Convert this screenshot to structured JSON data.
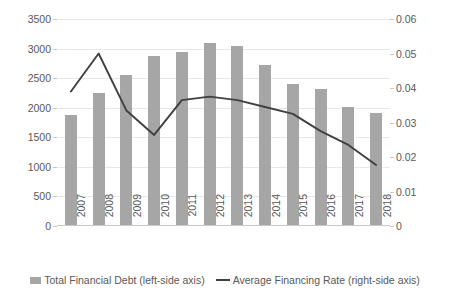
{
  "chart_data": {
    "type": "bar",
    "title": "",
    "subtitle": "",
    "xlabel": "",
    "ylabel": "",
    "categories": [
      "2007",
      "2008",
      "2009",
      "2010",
      "2011",
      "2012",
      "2013",
      "2014",
      "2015",
      "2016",
      "2017",
      "2018"
    ],
    "series": [
      {
        "name": "Total Financial Debt (left-side axis)",
        "type": "bar",
        "axis": "left",
        "color": "#a6a6a6",
        "values": [
          1880,
          2245,
          2545,
          2880,
          2950,
          3100,
          3040,
          2730,
          2405,
          2310,
          2020,
          1910
        ]
      },
      {
        "name": "Average Financing Rate (right-side axis)",
        "type": "line",
        "axis": "right",
        "color": "#404040",
        "values": [
          0.039,
          0.05,
          0.0335,
          0.0264,
          0.0365,
          0.0375,
          0.0365,
          0.0345,
          0.0325,
          0.0275,
          0.0235,
          0.0177
        ]
      }
    ],
    "left_axis": {
      "min": 0,
      "max": 3500,
      "step": 500,
      "ticks": [
        "0",
        "500",
        "1000",
        "1500",
        "2000",
        "2500",
        "3000",
        "3500"
      ]
    },
    "right_axis": {
      "min": 0,
      "max": 0.06,
      "step": 0.01,
      "ticks": [
        "0",
        "0.01",
        "0.02",
        "0.03",
        "0.04",
        "0.05",
        "0.06"
      ]
    },
    "grid": true,
    "legend_position": "bottom"
  },
  "legend": {
    "items": [
      {
        "label": "Total Financial Debt (left-side axis)",
        "marker": "bar-swatch"
      },
      {
        "label": "Average Financing Rate (right-side axis)",
        "marker": "line-swatch"
      }
    ]
  }
}
